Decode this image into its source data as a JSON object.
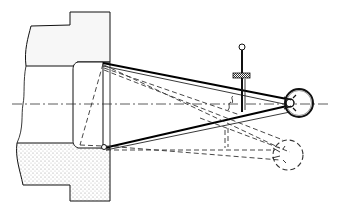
{
  "figure": {
    "type": "mechanical line drawing",
    "colors": {
      "line": "#111111",
      "stipple": "#dcdcdc",
      "background": "#ffffff"
    },
    "parts": [
      {
        "name": "upper-workpiece-block"
      },
      {
        "name": "lower-workpiece-block-stippled"
      },
      {
        "name": "bushing-collar"
      },
      {
        "name": "centerline"
      },
      {
        "name": "upper-arm"
      },
      {
        "name": "lower-arm"
      },
      {
        "name": "pivot-ring"
      },
      {
        "name": "adjusting-screw-with-knurled-nut"
      },
      {
        "name": "alternate-position-dashed"
      }
    ]
  }
}
